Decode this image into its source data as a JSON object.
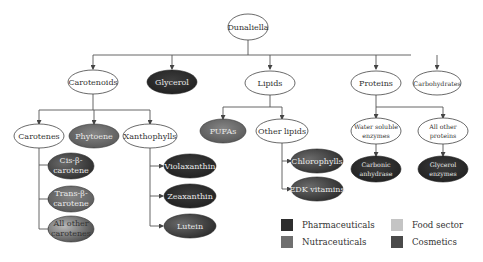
{
  "diagram": {
    "root": "Dunaliella",
    "nodes": {
      "dunaliella": "Dunaliella",
      "carotenoids": "Carotenoids",
      "glycerol": "Glycerol",
      "lipids": "Lipids",
      "proteins": "Proteins",
      "carbohydrates": "Carbohydrates",
      "carotenes": "Carotenes",
      "phytoene": "Phytoene",
      "xanthophylls": "Xanthophylls",
      "pufas": "PUFAs",
      "other_lipids": "Other lipids",
      "water_soluble_enzymes_1": "Water soluble",
      "water_soluble_enzymes_2": "enzymes",
      "all_other_proteins_1": "All other",
      "all_other_proteins_2": "proteins",
      "cis_beta_carotene_1": "Cis-β-",
      "cis_beta_carotene_2": "carotene",
      "trans_beta_carotene_1": "Trans-β-",
      "trans_beta_carotene_2": "carotene",
      "all_other_carotenes_1": "All other",
      "all_other_carotenes_2": "carotenes",
      "violaxanthin": "Violaxanthin",
      "zeaxanthin": "Zeaxanthin",
      "lutein": "Lutein",
      "chlorophylls": "Chlorophylls",
      "edk_vitamins": "EDK vitamins",
      "carbonic_anhydrase_1": "Carbonic",
      "carbonic_anhydrase_2": "anhydrase",
      "glycerol_enzymes_1": "Glycerol",
      "glycerol_enzymes_2": "enzymes"
    },
    "edges": [
      [
        "Dunaliella",
        "Carotenoids"
      ],
      [
        "Dunaliella",
        "Glycerol"
      ],
      [
        "Dunaliella",
        "Lipids"
      ],
      [
        "Dunaliella",
        "Proteins"
      ],
      [
        "Dunaliella",
        "Carbohydrates"
      ],
      [
        "Carotenoids",
        "Carotenes"
      ],
      [
        "Carotenoids",
        "Phytoene"
      ],
      [
        "Carotenoids",
        "Xanthophylls"
      ],
      [
        "Carotenes",
        "Cis-β-carotene"
      ],
      [
        "Carotenes",
        "Trans-β-carotene"
      ],
      [
        "Carotenes",
        "All other carotenes"
      ],
      [
        "Xanthophylls",
        "Violaxanthin"
      ],
      [
        "Xanthophylls",
        "Zeaxanthin"
      ],
      [
        "Xanthophylls",
        "Lutein"
      ],
      [
        "Lipids",
        "PUFAs"
      ],
      [
        "Lipids",
        "Other lipids"
      ],
      [
        "Other lipids",
        "Chlorophylls"
      ],
      [
        "Other lipids",
        "EDK vitamins"
      ],
      [
        "Proteins",
        "Water soluble enzymes"
      ],
      [
        "Proteins",
        "All other proteins"
      ],
      [
        "Water soluble enzymes",
        "Carbonic anhydrase"
      ],
      [
        "All other proteins",
        "Glycerol enzymes"
      ]
    ],
    "categories": {
      "pharmaceuticals": [
        "Glycerol",
        "Violaxanthin",
        "Zeaxanthin",
        "Carbonic anhydrase",
        "Glycerol enzymes"
      ],
      "nutraceuticals": [
        "Phytoene",
        "PUFAs",
        "Trans-β-carotene",
        "Lutein",
        "Chlorophylls",
        "EDK vitamins",
        "Cis-β-carotene"
      ],
      "food_sector": [
        "All other carotenes"
      ],
      "cosmetics": []
    }
  },
  "legend": {
    "items": [
      {
        "label": "Pharmaceuticals",
        "color": "#2e2e2e"
      },
      {
        "label": "Nutraceuticals",
        "color": "#6f6f6f"
      },
      {
        "label": "Food sector",
        "color": "#c4c4c4"
      },
      {
        "label": "Cosmetics",
        "color": "#4a4a4a"
      }
    ]
  },
  "colors": {
    "pharmaceuticals": "#2e2e2e",
    "nutraceuticals": "#6f6f6f",
    "food_sector": "#c4c4c4",
    "cosmetics": "#4a4a4a",
    "line": "#555555",
    "outline": "#444444"
  }
}
